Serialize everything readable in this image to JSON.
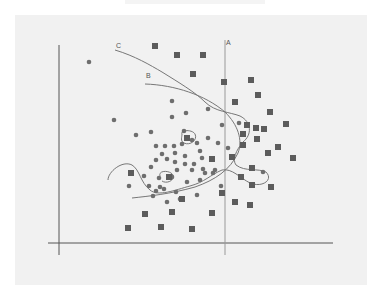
{
  "chart_data": {
    "type": "scatter",
    "title": "",
    "xlabel": "",
    "ylabel": "",
    "grid": false,
    "legend": "none",
    "annotations": [
      {
        "label": "A",
        "kind": "vertical-line decision boundary",
        "x": 225
      },
      {
        "label": "B",
        "kind": "curved decision boundary"
      },
      {
        "label": "C",
        "kind": "highly-fitted curved decision boundary"
      }
    ],
    "colors": {
      "circle": "#6e6e6e",
      "square": "#5c5c5c",
      "curve": "#777777",
      "axis": "#555555",
      "background": "#f1f1f1"
    },
    "series": [
      {
        "name": "circles",
        "marker": "circle",
        "points": [
          [
            89,
            62
          ],
          [
            114,
            120
          ],
          [
            136,
            135
          ],
          [
            151,
            132
          ],
          [
            172,
            101
          ],
          [
            172,
            117
          ],
          [
            186,
            113
          ],
          [
            208,
            109
          ],
          [
            184,
            131
          ],
          [
            208,
            138
          ],
          [
            222,
            125
          ],
          [
            156,
            146
          ],
          [
            165,
            146
          ],
          [
            174,
            146
          ],
          [
            182,
            144
          ],
          [
            162,
            154
          ],
          [
            175,
            153
          ],
          [
            185,
            156
          ],
          [
            197,
            143
          ],
          [
            200,
            151
          ],
          [
            156,
            160
          ],
          [
            167,
            159
          ],
          [
            175,
            162
          ],
          [
            185,
            164
          ],
          [
            194,
            164
          ],
          [
            151,
            167
          ],
          [
            177,
            170
          ],
          [
            192,
            170
          ],
          [
            203,
            169
          ],
          [
            215,
            170
          ],
          [
            159,
            178
          ],
          [
            172,
            177
          ],
          [
            187,
            182
          ],
          [
            200,
            180
          ],
          [
            213,
            173
          ],
          [
            164,
            189
          ],
          [
            149,
            186
          ],
          [
            176,
            192
          ],
          [
            156,
            191
          ],
          [
            167,
            202
          ],
          [
            180,
            199
          ],
          [
            205,
            173
          ],
          [
            239,
            123
          ],
          [
            221,
            186
          ],
          [
            218,
            143
          ],
          [
            202,
            158
          ],
          [
            197,
            195
          ],
          [
            192,
            140
          ],
          [
            228,
            148
          ],
          [
            263,
            172
          ],
          [
            144,
            176
          ],
          [
            160,
            187
          ],
          [
            129,
            186
          ],
          [
            153,
            196
          ]
        ]
      },
      {
        "name": "squares",
        "marker": "square",
        "points": [
          [
            155,
            46
          ],
          [
            177,
            55
          ],
          [
            203,
            55
          ],
          [
            193,
            74
          ],
          [
            224,
            82
          ],
          [
            251,
            80
          ],
          [
            258,
            95
          ],
          [
            235,
            102
          ],
          [
            270,
            112
          ],
          [
            247,
            125
          ],
          [
            286,
            124
          ],
          [
            256,
            128
          ],
          [
            264,
            129
          ],
          [
            243,
            134
          ],
          [
            257,
            139
          ],
          [
            278,
            147
          ],
          [
            243,
            145
          ],
          [
            268,
            153
          ],
          [
            232,
            157
          ],
          [
            293,
            158
          ],
          [
            252,
            168
          ],
          [
            241,
            177
          ],
          [
            252,
            185
          ],
          [
            271,
            187
          ],
          [
            212,
            159
          ],
          [
            187,
            138
          ],
          [
            131,
            173
          ],
          [
            169,
            177
          ],
          [
            235,
            202
          ],
          [
            222,
            193
          ],
          [
            212,
            213
          ],
          [
            145,
            214
          ],
          [
            172,
            212
          ],
          [
            192,
            229
          ],
          [
            161,
            227
          ],
          [
            128,
            228
          ],
          [
            250,
            205
          ],
          [
            182,
            199
          ]
        ]
      }
    ],
    "xlim": [
      59,
      333
    ],
    "ylim": [
      243,
      45
    ]
  }
}
